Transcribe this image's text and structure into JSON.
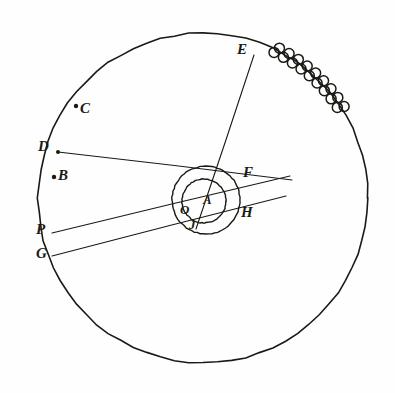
{
  "figure": {
    "kind": "hand-drawn geometry figure",
    "background_color": "#fefefe",
    "ink_color": "#1a1a14"
  },
  "circles": [
    {
      "name": "outer-circle",
      "cx": 203,
      "cy": 198,
      "r": 165,
      "stroke": "#1a1a14",
      "stroke_width": 1.6
    },
    {
      "name": "middle-circle",
      "cx": 206,
      "cy": 200,
      "r": 34,
      "stroke": "#1a1a14",
      "stroke_width": 1.4
    },
    {
      "name": "inner-circle",
      "cx": 204,
      "cy": 201,
      "r": 22,
      "stroke": "#1a1a14",
      "stroke_width": 1.4
    }
  ],
  "lines": [
    {
      "name": "line-E-to-J",
      "x1": 254,
      "y1": 55,
      "x2": 196,
      "y2": 229
    },
    {
      "name": "line-D-to-F",
      "x1": 58,
      "y1": 152,
      "x2": 292,
      "y2": 180
    },
    {
      "name": "line-P-to-right",
      "x1": 52,
      "y1": 233,
      "x2": 290,
      "y2": 176
    },
    {
      "name": "line-G-to-right",
      "x1": 52,
      "y1": 256,
      "x2": 286,
      "y2": 196
    }
  ],
  "points": [
    {
      "name": "point-C",
      "cx": 76,
      "cy": 106,
      "r": 2.2,
      "dot": true
    },
    {
      "name": "point-D",
      "cx": 58,
      "cy": 152,
      "r": 2.0,
      "dot": true
    },
    {
      "name": "point-B",
      "cx": 54,
      "cy": 177,
      "r": 2.2,
      "dot": true
    },
    {
      "name": "point-P",
      "cx": 52,
      "cy": 233,
      "r": 1.6,
      "dot": false
    },
    {
      "name": "point-G",
      "cx": 53,
      "cy": 256,
      "r": 1.6,
      "dot": false
    },
    {
      "name": "point-E",
      "cx": 256,
      "cy": 52,
      "r": 1.6,
      "dot": false
    },
    {
      "name": "point-A",
      "cx": 204,
      "cy": 201,
      "r": 1.4,
      "dot": false
    }
  ],
  "bead_band": {
    "name": "beaded-arc",
    "description": "double chain of small circles along upper-right circumference",
    "bead_count": 9,
    "bead_radius": 5.0,
    "start_angle_deg": -64,
    "end_angle_deg": -34,
    "rows": 2
  },
  "labels": [
    {
      "name": "label-E",
      "text": "E",
      "x": 237,
      "y": 42
    },
    {
      "name": "label-C",
      "text": "C",
      "x": 80,
      "y": 101
    },
    {
      "name": "label-D",
      "text": "D",
      "x": 38,
      "y": 139
    },
    {
      "name": "label-B",
      "text": "B",
      "x": 58,
      "y": 168
    },
    {
      "name": "label-F",
      "text": "F",
      "x": 243,
      "y": 165
    },
    {
      "name": "label-A",
      "text": "A",
      "x": 203,
      "y": 193
    },
    {
      "name": "label-O",
      "text": "O",
      "x": 180,
      "y": 203
    },
    {
      "name": "label-H",
      "text": "H",
      "x": 241,
      "y": 205
    },
    {
      "name": "label-P",
      "text": "P",
      "x": 36,
      "y": 222
    },
    {
      "name": "label-J",
      "text": "J",
      "x": 189,
      "y": 218
    },
    {
      "name": "label-G",
      "text": "G",
      "x": 36,
      "y": 246
    }
  ]
}
